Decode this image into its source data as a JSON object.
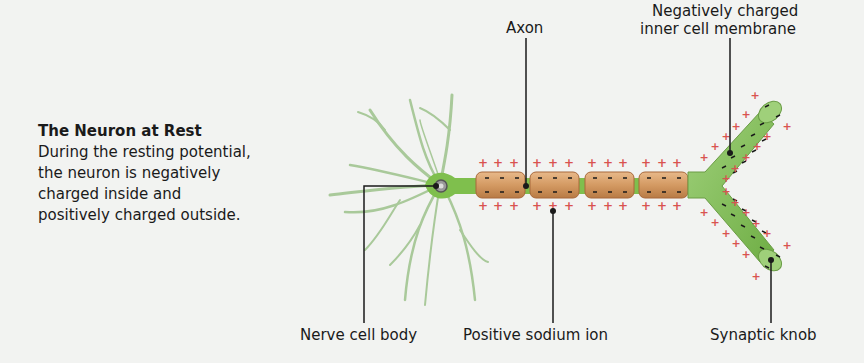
{
  "caption": {
    "title": "The Neuron at Rest",
    "lines": [
      "During the resting potential,",
      "the neuron is negatively",
      "charged inside and",
      "positively charged outside."
    ]
  },
  "labels": {
    "axon": "Axon",
    "membrane_line1": "Negatively charged",
    "membrane_line2": "inner cell membrane",
    "cell_body": "Nerve cell body",
    "sodium_ion": "Positive sodium ion",
    "synaptic_knob": "Synaptic knob"
  },
  "colors": {
    "background": "#f2f3f1",
    "neuron_green": "#7fbf4d",
    "dendrite_green": "#a9c99a",
    "myelin": "#d49a63",
    "myelin_border": "#a8683a",
    "plus_sign": "#d9534f",
    "leader_line": "#1a1a1a"
  }
}
